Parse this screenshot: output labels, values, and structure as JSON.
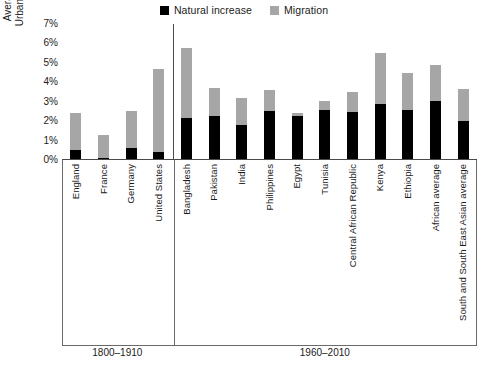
{
  "legend": {
    "entries": [
      {
        "label": "Natural increase",
        "color": "#000000",
        "key": "natural-increase"
      },
      {
        "label": "Migration",
        "color": "#a6a6a6",
        "key": "migration"
      }
    ]
  },
  "axis": {
    "ylabel_line1": "Average Annual",
    "ylabel_line2": "Urban Growth (%)",
    "yticks": [
      "0%",
      "1%",
      "2%",
      "3%",
      "4%",
      "5%",
      "6%",
      "7%"
    ]
  },
  "groups": [
    {
      "label": "1800–1910",
      "count": 4
    },
    {
      "label": "1960–2010",
      "count": 11
    }
  ],
  "chart_data": {
    "type": "bar",
    "title": "",
    "xlabel": "",
    "ylabel": "Average Annual Urban Growth (%)",
    "ylim": [
      0,
      7
    ],
    "yticks": [
      0,
      1,
      2,
      3,
      4,
      5,
      6,
      7
    ],
    "grid": false,
    "stacked": true,
    "legend_position": "top-center",
    "categories": [
      "England",
      "France",
      "Germany",
      "United States",
      "Bangladesh",
      "Pakistan",
      "India",
      "Philippines",
      "Egypt",
      "Tunisia",
      "Central African Republic",
      "Kenya",
      "Ethiopia",
      "African average",
      "South and South East Asian average"
    ],
    "group_labels": [
      "1800–1910",
      "1800–1910",
      "1800–1910",
      "1800–1910",
      "1960–2010",
      "1960–2010",
      "1960–2010",
      "1960–2010",
      "1960–2010",
      "1960–2010",
      "1960–2010",
      "1960–2010",
      "1960–2010",
      "1960–2010",
      "1960–2010"
    ],
    "series": [
      {
        "name": "Natural increase",
        "color": "#000000",
        "values": [
          0.5,
          0.1,
          0.6,
          0.4,
          2.15,
          2.25,
          1.8,
          2.5,
          2.25,
          2.6,
          2.45,
          2.9,
          2.6,
          3.05,
          2.0
        ]
      },
      {
        "name": "Migration",
        "color": "#a6a6a6",
        "values": [
          1.9,
          1.2,
          1.9,
          4.3,
          3.6,
          1.45,
          1.4,
          1.1,
          0.15,
          0.45,
          1.05,
          2.6,
          1.9,
          1.85,
          1.65
        ]
      }
    ],
    "totals": [
      2.4,
      1.3,
      2.5,
      4.7,
      5.75,
      3.7,
      3.2,
      3.6,
      2.4,
      3.05,
      3.5,
      5.5,
      4.5,
      4.9,
      3.65
    ]
  }
}
